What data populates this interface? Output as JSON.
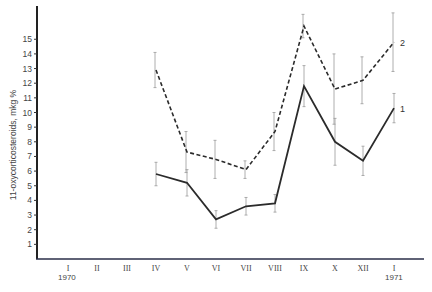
{
  "chart_data": {
    "type": "line",
    "title": "",
    "xlabel": "",
    "ylabel": "11-oxycorticosteroids, mkg %",
    "ylim": [
      0,
      17
    ],
    "yticks": [
      1,
      2,
      3,
      4,
      5,
      6,
      7,
      8,
      9,
      10,
      11,
      12,
      13,
      14,
      15
    ],
    "x_axis_ticks": [
      "I",
      "II",
      "III",
      "IV",
      "V",
      "VI",
      "VII",
      "VIII",
      "IX",
      "X",
      "XII",
      "I"
    ],
    "year_labels": [
      {
        "label": "1970",
        "at": "I"
      },
      {
        "label": "1971",
        "at": "I (2nd)"
      }
    ],
    "categories": [
      "IV",
      "V",
      "VI",
      "VII",
      "VIII",
      "IX",
      "X",
      "XII",
      "I"
    ],
    "series": [
      {
        "name": "1",
        "style": "solid",
        "values": [
          5.8,
          5.2,
          2.7,
          3.6,
          3.8,
          11.8,
          8.0,
          6.7,
          10.3
        ],
        "error": [
          0.8,
          0.9,
          0.6,
          0.6,
          0.6,
          1.4,
          1.6,
          1.0,
          1.0
        ]
      },
      {
        "name": "2",
        "style": "dashed",
        "values": [
          12.9,
          7.3,
          6.8,
          6.1,
          8.7,
          15.9,
          11.6,
          12.2,
          14.8
        ],
        "error": [
          1.2,
          1.4,
          1.3,
          0.6,
          1.3,
          0.8,
          2.4,
          1.6,
          2.0
        ]
      }
    ],
    "grid": false,
    "legend": "inline labels at line ends"
  },
  "labels": {
    "ylabel": "11-oxycorticosteroids, mkg %",
    "year_start": "1970",
    "year_end": "1971",
    "series1": "1",
    "series2": "2"
  }
}
